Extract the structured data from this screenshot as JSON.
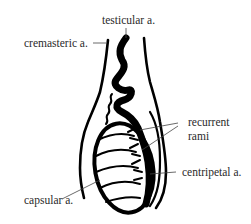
{
  "figure": {
    "labels": {
      "testicular": "testicular a.",
      "cremasteric": "cremasteric a.",
      "recurrent_line1": "recurrent",
      "recurrent_line2": "rami",
      "centripetal": "centripetal a.",
      "capsular": "capsular a."
    },
    "colors": {
      "ink": "#000000",
      "text": "#2a2a2a",
      "leader": "#444444",
      "background": "#ffffff"
    }
  }
}
